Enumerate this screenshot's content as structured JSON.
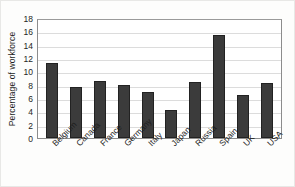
{
  "chart_data": {
    "type": "bar",
    "title": "",
    "xlabel": "",
    "ylabel": "Percentage of workforce",
    "categories": [
      "Belgium",
      "Canada",
      "France",
      "Germany",
      "Italy",
      "Japan",
      "Russia",
      "Spain",
      "UK",
      "USA"
    ],
    "values": [
      11.2,
      7.7,
      8.5,
      8.0,
      6.9,
      4.2,
      8.4,
      15.4,
      6.4,
      8.3
    ],
    "ylim": [
      0,
      18
    ],
    "yticks": [
      0,
      2,
      4,
      6,
      8,
      10,
      12,
      14,
      16,
      18
    ],
    "ytick_labels": [
      "0",
      "2",
      "4",
      "6",
      "8",
      "10",
      "12",
      "14",
      "16",
      "18"
    ],
    "grid": true,
    "grid_axis": "y",
    "legend": false,
    "bar_color": "#3b3b3b",
    "grid_color": "#dcdcdc",
    "axis_color": "#8c8c8c",
    "background_color": "#ffffff"
  }
}
